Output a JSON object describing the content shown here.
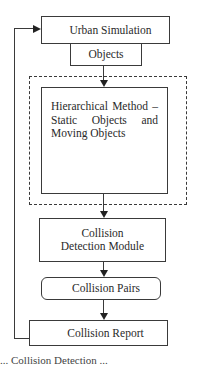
{
  "diagram": {
    "type": "flowchart",
    "nodes": {
      "urban_simulation": "Urban Simulation",
      "objects": "Objects",
      "hierarchical_method": "Hierarchical Method – Static Objects and Moving Objects",
      "collision_detection": "Collision Detection Module",
      "collision_pairs": "Collision Pairs",
      "collision_report": "Collision Report"
    },
    "edges": [
      {
        "from": "objects",
        "to": "hierarchical_method"
      },
      {
        "from": "hierarchical_method",
        "to": "collision_detection"
      },
      {
        "from": "collision_detection",
        "to": "collision_pairs"
      },
      {
        "from": "collision_pairs",
        "to": "collision_report"
      },
      {
        "from": "collision_report",
        "to": "urban_simulation",
        "type": "feedback"
      }
    ],
    "caption_partial": "... Collision Detection ..."
  }
}
